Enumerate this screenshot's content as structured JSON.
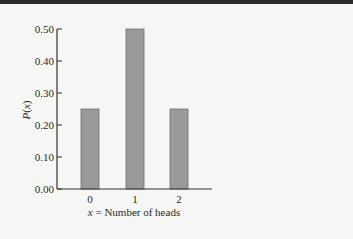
{
  "chart_data": {
    "type": "bar",
    "title": "",
    "categories": [
      "0",
      "1",
      "2"
    ],
    "values": [
      0.25,
      0.5,
      0.25
    ],
    "xlabel": "x = Number of heads",
    "xlabel_var": "x",
    "xlabel_rest": " = Number of heads",
    "ylabel": "P(x)",
    "ylim": [
      0,
      0.5
    ],
    "yticks": [
      "0.00",
      "0.10",
      "0.20",
      "0.30",
      "0.40",
      "0.50"
    ],
    "grid": false,
    "legend": null,
    "bar_color": "#9a9a9a",
    "bar_edge_color": "#6e6e6e"
  }
}
